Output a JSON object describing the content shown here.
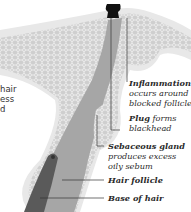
{
  "diagram": {
    "left_text_fragments": [
      "hair",
      "ess",
      "d"
    ],
    "labels": [
      {
        "title": "Inflammation",
        "desc": [
          "occurs around",
          "blocked follicle"
        ]
      },
      {
        "title": "Plug",
        "desc_inline": "forms",
        "desc": [
          "blackhead"
        ]
      },
      {
        "title": "Sebaceous gland",
        "desc": [
          "produces excess",
          "oily sebum"
        ]
      },
      {
        "title": "Hair follicle",
        "desc": []
      },
      {
        "title": "Base of hair",
        "desc": []
      }
    ],
    "colors": {
      "skin_light": "#e6e6e6",
      "skin_mid": "#c9c9c9",
      "follicle": "#9a9a9a",
      "hair": "#555555",
      "plug": "#111111",
      "text": "#2a2a2a"
    }
  }
}
